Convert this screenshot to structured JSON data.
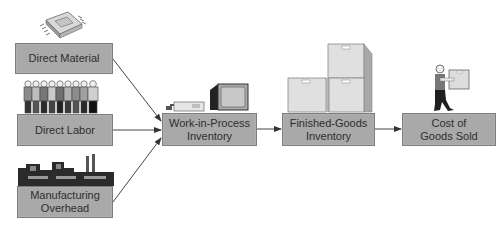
{
  "diagram": {
    "type": "flowchart",
    "title": "",
    "colors": {
      "box_fill": "#a9a9a9",
      "box_border": "#7d7d7d",
      "text": "#2e2e2e",
      "arrow": "#333333"
    },
    "nodes": [
      {
        "id": "direct-material",
        "label": "Direct Material",
        "icon": "microchip-icon"
      },
      {
        "id": "direct-labor",
        "label": "Direct Labor",
        "icon": "workers-group-icon"
      },
      {
        "id": "manufacturing-overhead",
        "label_line1": "Manufacturing",
        "label_line2": "Overhead",
        "icon": "factory-icon"
      },
      {
        "id": "work-in-process",
        "label_line1": "Work-in-Process",
        "label_line2": "Inventory",
        "icon": "computer-equipment-icon"
      },
      {
        "id": "finished-goods",
        "label_line1": "Finished-Goods",
        "label_line2": "Inventory",
        "icon": "stacked-boxes-icon"
      },
      {
        "id": "cost-of-goods-sold",
        "label_line1": "Cost of",
        "label_line2": "Goods Sold",
        "icon": "person-carrying-box-icon"
      }
    ],
    "edges": [
      {
        "from": "direct-material",
        "to": "work-in-process"
      },
      {
        "from": "direct-labor",
        "to": "work-in-process"
      },
      {
        "from": "manufacturing-overhead",
        "to": "work-in-process"
      },
      {
        "from": "work-in-process",
        "to": "finished-goods"
      },
      {
        "from": "finished-goods",
        "to": "cost-of-goods-sold"
      }
    ]
  }
}
